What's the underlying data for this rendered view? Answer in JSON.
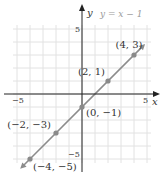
{
  "chart_data": {
    "type": "line",
    "title": "",
    "equation": "y = x − 1",
    "xlabel": "x",
    "ylabel": "y",
    "xlim": [
      -5,
      5
    ],
    "ylim": [
      -5,
      5
    ],
    "grid": true,
    "tick_labels": {
      "x_min": "−5",
      "x_max": "5",
      "y_min": "−5",
      "y_max": "5"
    },
    "points": [
      {
        "x": -4,
        "y": -5,
        "label": "(−4, −5)"
      },
      {
        "x": -2,
        "y": -3,
        "label": "(−2, −3)"
      },
      {
        "x": 0,
        "y": -1,
        "label": "(0, −1)"
      },
      {
        "x": 2,
        "y": 1,
        "label": "(2, 1)"
      },
      {
        "x": 4,
        "y": 3,
        "label": "(4, 3)"
      }
    ],
    "line": {
      "slope": 1,
      "intercept": -1,
      "color": "#8c8c8c"
    },
    "point_color": "#8a8a8a",
    "grid_color": "#e2e2e2",
    "axis_color": "#222222"
  }
}
